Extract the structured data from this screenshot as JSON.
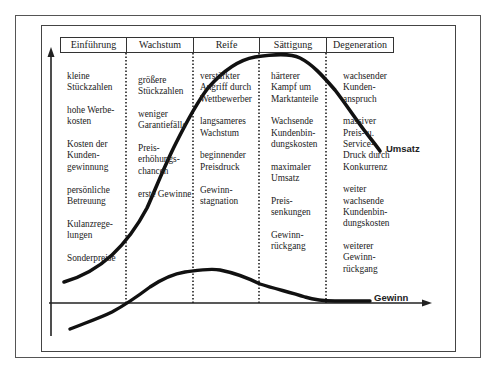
{
  "diagram": {
    "phases": [
      {
        "label": "Einführung",
        "items": [
          "kleine\nStückzahlen",
          "hohe Werbe-\nkosten",
          "Kosten der\nKunden-\ngewinnung",
          "persönliche\nBetreuung",
          "Kulanzrege-\nlungen",
          "Sonderpreise"
        ]
      },
      {
        "label": "Wachstum",
        "items": [
          "größere\nStückzahlen",
          "weniger\nGarantiefälle",
          "Preis-\nerhöhungs-\nchancen",
          "erste Gewinne"
        ]
      },
      {
        "label": "Reife",
        "items": [
          "verstärkter\nAngriff durch\nWettbewerber",
          "langsameres\nWachstum",
          "beginnender\nPreisdruck",
          "Gewinn-\nstagnation"
        ]
      },
      {
        "label": "Sättigung",
        "items": [
          "härterer\nKampf um\nMarktanteile",
          "Wachsende\nKundenbin-\ndungskosten",
          "maximaler\nUmsatz",
          "Preis-\nsenkungen",
          "Gewinn-\nrückgang"
        ]
      },
      {
        "label": "Degeneration",
        "items": [
          "wachsender\nKunden-\nanspruch",
          "massiver\nPreis- u.\nService-\nDruck durch\nKonkurrenz",
          "weiter\nwachsende\nKundenbin-\ndungskosten",
          "weiterer\nGewinn-\nrückgang"
        ]
      }
    ],
    "curves": [
      {
        "name": "Umsatz",
        "label": "Umsatz"
      },
      {
        "name": "Gewinn",
        "label": "Gewinn"
      }
    ]
  }
}
